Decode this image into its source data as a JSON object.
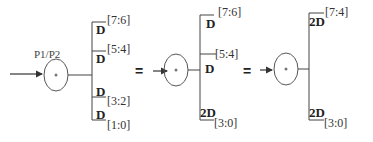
{
  "diagram": {
    "colors": {
      "stroke": "#444444",
      "text": "#222222",
      "background": "#ffffff"
    },
    "equals_sign": "=",
    "group1": {
      "node_label": "P1/P2",
      "node_symbol": "*",
      "branches": [
        {
          "reg": "D",
          "range": "[7:6]"
        },
        {
          "reg": "D",
          "range": "[5:4]"
        },
        {
          "reg": "D",
          "range": "[3:2]"
        },
        {
          "reg": "D",
          "range": "[1:0]"
        }
      ]
    },
    "group2": {
      "node_symbol": "*",
      "branches": [
        {
          "reg": "D",
          "range": "[7:6]"
        },
        {
          "reg": "D",
          "range": "[5:4]"
        },
        {
          "reg": "2D",
          "range": "[3:0]"
        }
      ]
    },
    "group3": {
      "node_symbol": "*",
      "branches": [
        {
          "reg": "2D",
          "range": "[7:4]"
        },
        {
          "reg": "2D",
          "range": "[3:0]"
        }
      ]
    }
  }
}
